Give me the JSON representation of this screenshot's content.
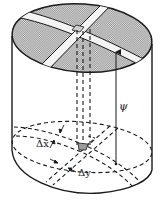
{
  "figure": {
    "labels": {
      "delta_x": "Δx",
      "delta_y": "Δy",
      "psi": "ψ"
    },
    "colors": {
      "line": "#1a1a1a",
      "top_fill": "#b9b9b9",
      "background": "#ffffff"
    }
  }
}
